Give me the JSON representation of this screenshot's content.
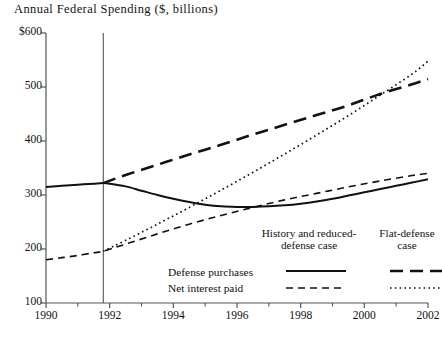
{
  "chart_data": {
    "type": "line",
    "title": "Annual Federal Spending ($, billions)",
    "xlabel": "",
    "ylabel": "",
    "xlim": [
      1990,
      2002
    ],
    "ylim": [
      100,
      600
    ],
    "ytick_labels": [
      "$600",
      "500",
      "400",
      "300",
      "200",
      "100"
    ],
    "ytick_values": [
      600,
      500,
      400,
      300,
      200,
      100
    ],
    "xtick_labels": [
      "1990",
      "1992",
      "1994",
      "1996",
      "1998",
      "2000",
      "2002"
    ],
    "xtick_values": [
      1990,
      1992,
      1994,
      1996,
      1998,
      2000,
      2002
    ],
    "minor_xticks": [
      1991,
      1993,
      1995,
      1997,
      1999,
      2001
    ],
    "grid": false,
    "legend_position": "inside-lower-right",
    "annotations": [
      {
        "name": "forecast-divider",
        "type": "vertical-line",
        "x": 1991.8
      }
    ],
    "series": [
      {
        "name": "Defense purchases — History and reduced-defense case",
        "style": "solid",
        "x": [
          1990,
          1990.5,
          1991,
          1991.5,
          1991.8,
          1992,
          1992.5,
          1993,
          1993.5,
          1994,
          1994.5,
          1995,
          1995.5,
          1996,
          1996.5,
          1997,
          1997.5,
          1998,
          1998.5,
          1999,
          1999.5,
          2000,
          2000.5,
          2001,
          2001.5,
          2002
        ],
        "y": [
          315,
          317,
          319,
          321,
          322,
          321,
          316,
          308,
          300,
          293,
          287,
          282,
          279,
          278,
          278,
          279,
          281,
          284,
          288,
          293,
          299,
          305,
          311,
          317,
          323,
          329
        ]
      },
      {
        "name": "Defense purchases — Flat-defense case",
        "style": "long-dash",
        "x": [
          1991.8,
          1992.5,
          1993.5,
          1994.5,
          1995.5,
          1996.5,
          1997.5,
          1998.5,
          1999.5,
          2000.5,
          2001.5,
          2002
        ],
        "y": [
          322,
          337,
          356,
          375,
          393,
          412,
          430,
          448,
          466,
          487,
          505,
          515
        ]
      },
      {
        "name": "Net interest paid — History and reduced-defense case",
        "style": "dash",
        "x": [
          1990,
          1990.5,
          1991,
          1991.5,
          1991.8,
          1992.5,
          1993.5,
          1994.5,
          1995.5,
          1996.5,
          1997.5,
          1998.5,
          1999.5,
          2000.5,
          2001.5,
          2002
        ],
        "y": [
          180,
          184,
          188,
          193,
          196,
          209,
          228,
          246,
          262,
          277,
          291,
          303,
          315,
          326,
          336,
          340
        ]
      },
      {
        "name": "Net interest paid — Flat-defense case",
        "style": "dotted",
        "x": [
          1991.8,
          1992.5,
          1993.5,
          1994.5,
          1995.5,
          1996.5,
          1997.5,
          1998.5,
          1999.5,
          2000.5,
          2001.5,
          2002
        ],
        "y": [
          196,
          216,
          246,
          277,
          309,
          342,
          376,
          411,
          447,
          485,
          524,
          548
        ]
      }
    ],
    "legend": {
      "col_headers": [
        "History and reduced-defense case",
        "Flat-defense case"
      ],
      "row_labels": [
        "Defense purchases",
        "Net interest paid"
      ],
      "cells": [
        [
          {
            "style": "solid"
          },
          {
            "style": "long-dash"
          }
        ],
        [
          {
            "style": "dash"
          },
          {
            "style": "dotted"
          }
        ]
      ]
    },
    "colors": {
      "ink": "#111111",
      "axis": "#555555",
      "background": "#ffffff"
    }
  }
}
